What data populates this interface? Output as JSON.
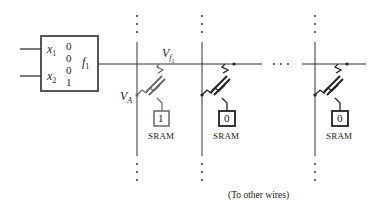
{
  "lut": {
    "inputs": [
      "x",
      "x"
    ],
    "input_subs": [
      "1",
      "2"
    ],
    "truth_values": [
      "0",
      "0",
      "0",
      "1"
    ],
    "output": "f",
    "output_sub": "1"
  },
  "labels": {
    "vf": "V",
    "vf_sub": "f",
    "vf_subsub": "1",
    "va": "V",
    "va_sub": "A"
  },
  "switches": [
    {
      "sram_bit": "1",
      "sram_label": "SRAM"
    },
    {
      "sram_bit": "0",
      "sram_label": "SRAM"
    },
    {
      "sram_bit": "0",
      "sram_label": "SRAM"
    }
  ],
  "ellipsis": "· · ·",
  "caption": "(To other wires)"
}
